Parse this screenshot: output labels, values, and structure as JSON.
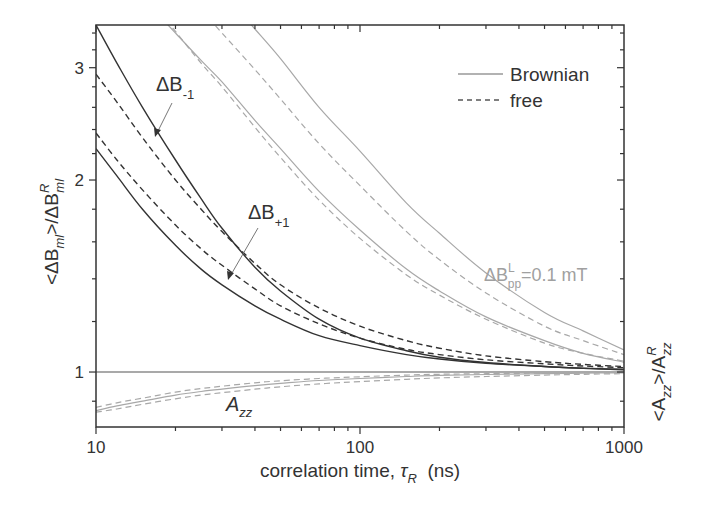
{
  "chart_data": {
    "type": "line",
    "title": "",
    "xlabel": "correlation time, τR (ns)",
    "xlabel_parts": {
      "prefix": "correlation time, ",
      "symbol": "τ",
      "sub": "R",
      "suffix": "  (ns)"
    },
    "ylabel_left": "<ΔBml>/ΔBml^R",
    "ylabel_left_parts": {
      "lt": "<ΔB",
      "sub1": "ml",
      "mid": ">/ΔB",
      "sup": "R",
      "sub2": "ml"
    },
    "ylabel_right": "<Azz>/Azz^R",
    "ylabel_right_parts": {
      "lt": "<A",
      "sub1": "zz",
      "mid": ">/A",
      "sup": "R",
      "sub2": "zz"
    },
    "xscale": "log",
    "yscale": "log",
    "xlim": [
      10,
      1000
    ],
    "ylim": [
      0.82,
      3.5
    ],
    "xticks": [
      10,
      100,
      1000
    ],
    "xtick_labels": [
      "10",
      "100",
      "1000"
    ],
    "yticks": [
      1,
      2,
      3
    ],
    "ytick_labels": [
      "1",
      "2",
      "3"
    ],
    "grid": false,
    "legend": {
      "position": "upper right",
      "entries": [
        {
          "label": "Brownian",
          "style": "solid"
        },
        {
          "label": "free",
          "style": "dashed"
        }
      ]
    },
    "annotations": [
      {
        "text": "ΔB-1",
        "main": "ΔB",
        "sub": "-1",
        "target": "black solid upper curve",
        "at_x": 25
      },
      {
        "text": "ΔB+1",
        "main": "ΔB",
        "sub": "+1",
        "target": "black solid lower curve",
        "at_x": 30
      },
      {
        "text": "ΔBpp^L=0.1 mT",
        "main": "ΔB",
        "sup": "L",
        "sub": "pp",
        "rest": "=0.1 mT",
        "color": "#a0a0a0"
      },
      {
        "text": "Azz",
        "main": "A",
        "sub": "zz"
      }
    ],
    "x": [
      10,
      12,
      15,
      20,
      25,
      30,
      40,
      50,
      70,
      100,
      150,
      200,
      300,
      500,
      700,
      1000
    ],
    "series": [
      {
        "name": "ΔB-1 Brownian (black)",
        "color": "#333333",
        "style": "solid",
        "values": [
          3.5,
          3.05,
          2.6,
          2.15,
          1.87,
          1.68,
          1.46,
          1.34,
          1.21,
          1.13,
          1.08,
          1.055,
          1.035,
          1.02,
          1.013,
          1.008
        ]
      },
      {
        "name": "ΔB-1 free (black)",
        "color": "#333333",
        "style": "dashed",
        "values": [
          2.93,
          2.65,
          2.33,
          2.0,
          1.8,
          1.66,
          1.48,
          1.37,
          1.26,
          1.18,
          1.12,
          1.09,
          1.06,
          1.038,
          1.028,
          1.02
        ]
      },
      {
        "name": "ΔB+1 free (black)",
        "color": "#333333",
        "style": "dashed",
        "values": [
          2.37,
          2.15,
          1.93,
          1.7,
          1.56,
          1.47,
          1.35,
          1.27,
          1.19,
          1.13,
          1.085,
          1.065,
          1.045,
          1.03,
          1.022,
          1.016
        ]
      },
      {
        "name": "ΔB+1 Brownian (black)",
        "color": "#333333",
        "style": "solid",
        "values": [
          2.24,
          2.03,
          1.8,
          1.58,
          1.45,
          1.37,
          1.27,
          1.21,
          1.14,
          1.1,
          1.065,
          1.048,
          1.032,
          1.02,
          1.014,
          1.01
        ]
      },
      {
        "name": "ΔBpp^L=0.1 mT free 1 (gray)",
        "color": "#a8a8a8",
        "style": "dashed",
        "values": [
          null,
          null,
          null,
          3.42,
          3.05,
          2.8,
          2.42,
          2.17,
          1.86,
          1.62,
          1.42,
          1.32,
          1.21,
          1.11,
          1.07,
          1.04
        ]
      },
      {
        "name": "ΔBpp^L=0.1 mT Brownian 1 (gray)",
        "color": "#a8a8a8",
        "style": "solid",
        "values": [
          null,
          null,
          null,
          3.4,
          3.08,
          2.85,
          2.48,
          2.24,
          1.92,
          1.67,
          1.45,
          1.34,
          1.22,
          1.12,
          1.07,
          1.036
        ]
      },
      {
        "name": "ΔBpp^L=0.1 mT free 2 (gray)",
        "color": "#a8a8a8",
        "style": "dashed",
        "values": [
          null,
          null,
          null,
          null,
          null,
          3.4,
          2.98,
          2.68,
          2.28,
          1.96,
          1.66,
          1.5,
          1.33,
          1.18,
          1.12,
          1.065
        ]
      },
      {
        "name": "ΔBpp^L=0.1 mT Brownian 2 (gray)",
        "color": "#a8a8a8",
        "style": "solid",
        "values": [
          null,
          null,
          null,
          null,
          null,
          null,
          3.45,
          3.1,
          2.6,
          2.22,
          1.84,
          1.65,
          1.43,
          1.24,
          1.16,
          1.083
        ]
      },
      {
        "name": "Reference line",
        "color": "#555555",
        "style": "solid",
        "values": [
          1,
          1,
          1,
          1,
          1,
          1,
          1,
          1,
          1,
          1,
          1,
          1,
          1,
          1,
          1,
          1
        ]
      },
      {
        "name": "Azz Brownian (gray)",
        "color": "#a8a8a8",
        "style": "solid",
        "values": [
          0.87,
          0.885,
          0.9,
          0.92,
          0.932,
          0.94,
          0.952,
          0.96,
          0.97,
          0.977,
          0.984,
          0.988,
          0.991,
          0.994,
          0.996,
          0.997
        ]
      },
      {
        "name": "Azz free upper (gray)",
        "color": "#a8a8a8",
        "style": "dashed",
        "values": [
          0.88,
          0.895,
          0.91,
          0.93,
          0.942,
          0.95,
          0.962,
          0.969,
          0.977,
          0.983,
          0.989,
          0.992,
          0.994,
          0.996,
          0.997,
          0.998
        ]
      },
      {
        "name": "Azz free lower (gray)",
        "color": "#a8a8a8",
        "style": "dashed",
        "values": [
          0.865,
          0.875,
          0.89,
          0.908,
          0.92,
          0.928,
          0.94,
          0.948,
          0.958,
          0.966,
          0.974,
          0.979,
          0.984,
          0.989,
          0.992,
          0.994
        ]
      }
    ]
  },
  "plot_area": {
    "left": 96,
    "right": 624,
    "top": 25,
    "bottom": 427
  }
}
